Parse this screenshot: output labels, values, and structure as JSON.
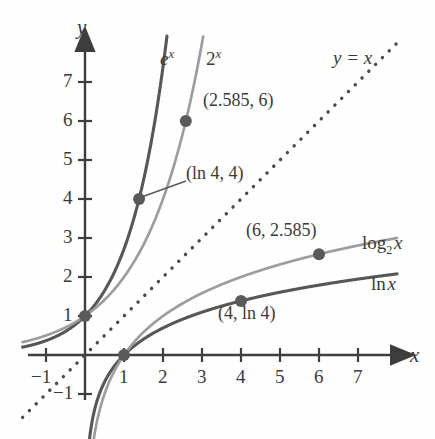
{
  "figure": {
    "kind": "math-function-graph",
    "background": "#fefefe",
    "ink": "#3d3d3d"
  },
  "axes": {
    "x_axis_label": "x",
    "y_axis_label": "y",
    "x_ticks": [
      "-1",
      "1",
      "2",
      "3",
      "4",
      "5",
      "6",
      "7"
    ],
    "y_ticks": [
      "-1",
      "1",
      "2",
      "3",
      "4",
      "5",
      "6",
      "7"
    ],
    "origin_px": [
      85,
      355
    ],
    "unit_px": 39,
    "xlim": [
      -1.6,
      8.0
    ],
    "ylim": [
      -1.6,
      7.6
    ],
    "grid": false,
    "arrowheads": [
      "x-positive",
      "y-positive"
    ]
  },
  "chart_data": {
    "type": "line",
    "title": "",
    "xlabel": "x",
    "ylabel": "y",
    "xlim": [
      -1.6,
      8.0
    ],
    "ylim": [
      -1.6,
      7.6
    ],
    "grid": false,
    "legend_position": "inline-curve-labels",
    "series": [
      {
        "name": "e^x",
        "label": "e",
        "label_exponent": "x",
        "color": "#575757",
        "width": 3.1,
        "style": "solid",
        "formula": "exp(x)",
        "label_px": [
          160,
          60
        ]
      },
      {
        "name": "2^x",
        "label": "2",
        "label_exponent": "x",
        "color": "#9d9d9d",
        "width": 2.7,
        "style": "solid",
        "formula": "pow(2,x)",
        "label_px": [
          206,
          60
        ]
      },
      {
        "name": "ln x",
        "label": "ln",
        "label_arg": "x",
        "color": "#575757",
        "width": 3.1,
        "style": "solid",
        "formula": "log(x)",
        "label_px": [
          371,
          283
        ]
      },
      {
        "name": "log_2 x",
        "label": "log",
        "label_sub": "2",
        "label_arg": "x",
        "color": "#9d9d9d",
        "width": 2.7,
        "style": "solid",
        "formula": "log2(x)",
        "label_px": [
          362,
          243
        ]
      },
      {
        "name": "y = x",
        "label": "y = x",
        "color": "#4a4a4a",
        "width": 3.0,
        "style": "dotted",
        "formula": "x",
        "label_px": [
          333,
          60
        ]
      }
    ],
    "annotated_points": [
      {
        "name": "point-0-1",
        "x": 0,
        "y": 1,
        "label": "",
        "on": "e^x / 2^x"
      },
      {
        "name": "point-1-0",
        "x": 1,
        "y": 0,
        "label": "",
        "on": "ln x / log_2 x"
      },
      {
        "name": "point-ln4-4",
        "x": 1.386,
        "y": 4,
        "label": "(ln 4, 4)",
        "on": "e^x",
        "label_px": [
          186,
          173
        ],
        "leader": true
      },
      {
        "name": "point-2585-6",
        "x": 2.585,
        "y": 6,
        "label": "(2.585, 6)",
        "on": "2^x",
        "label_px": [
          203,
          100
        ]
      },
      {
        "name": "point-4-ln4",
        "x": 4,
        "y": 1.386,
        "label": "(4, ln 4)",
        "on": "ln x",
        "label_px": [
          218,
          313
        ]
      },
      {
        "name": "point-6-2585",
        "x": 6,
        "y": 2.585,
        "label": "(6, 2.585)",
        "on": "log_2 x",
        "label_px": [
          246,
          230
        ]
      }
    ],
    "point_marker": {
      "color": "#5a5a5a",
      "radius": 6.0
    }
  }
}
